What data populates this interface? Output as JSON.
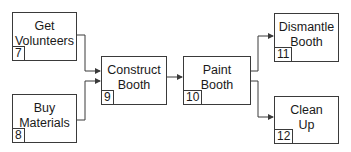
{
  "diagram": {
    "type": "network-diagram",
    "nodes": [
      {
        "id": "7",
        "label": "Get\nVolunteers"
      },
      {
        "id": "8",
        "label": "Buy\nMaterials"
      },
      {
        "id": "9",
        "label": "Construct\nBooth"
      },
      {
        "id": "10",
        "label": "Paint\nBooth"
      },
      {
        "id": "11",
        "label": "Dismantle\nBooth"
      },
      {
        "id": "12",
        "label": "Clean\nUp"
      }
    ],
    "edges": [
      {
        "from": "7",
        "to": "9"
      },
      {
        "from": "8",
        "to": "9"
      },
      {
        "from": "9",
        "to": "10"
      },
      {
        "from": "10",
        "to": "11"
      },
      {
        "from": "10",
        "to": "12"
      }
    ],
    "colors": {
      "line": "#3a3a3a",
      "text": "#1a1a1a",
      "background": "#ffffff"
    }
  }
}
